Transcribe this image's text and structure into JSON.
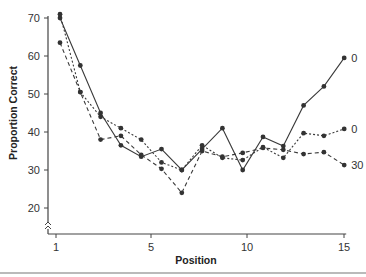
{
  "chart_data": {
    "type": "line",
    "title": "",
    "xlabel": "Position",
    "ylabel": "Proportion Correct",
    "x": [
      1,
      2,
      3,
      4,
      5,
      6,
      7,
      8,
      9,
      10,
      11,
      12,
      13,
      14,
      15
    ],
    "xticks": [
      1,
      5,
      10,
      15
    ],
    "yticks": [
      20,
      30,
      40,
      50,
      60,
      70
    ],
    "ylim": [
      15,
      72
    ],
    "xlim": [
      0.7,
      15.3
    ],
    "grid": false,
    "legend": "end-of-line labels",
    "series": [
      {
        "name": "0",
        "label": "0",
        "style": "solid",
        "values": [
          70,
          57.5,
          45,
          36.5,
          33.5,
          35.5,
          30,
          35.5,
          41,
          30,
          38.7,
          36.3,
          47,
          52,
          59.5
        ]
      },
      {
        "name": "0",
        "label": "0",
        "style": "dotted",
        "values": [
          71,
          50.5,
          44,
          41,
          38,
          32,
          30,
          36.5,
          33.2,
          32.6,
          36,
          33.2,
          39.7,
          39,
          40.8
        ]
      },
      {
        "name": "30",
        "label": "30",
        "style": "dashed",
        "values": [
          63.5,
          50.5,
          38,
          39,
          34,
          30.3,
          24,
          35,
          33.5,
          34.5,
          35.8,
          35.3,
          34.2,
          34.7,
          31.3
        ]
      }
    ]
  }
}
